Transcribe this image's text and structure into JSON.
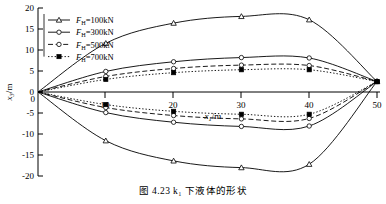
{
  "figure": {
    "caption": "图 4.23  k₁ 下液体的形状"
  },
  "chart_data": {
    "type": "line",
    "title": "",
    "xlabel": "x₁/m",
    "ylabel": "x₃/m",
    "xlim": [
      0,
      52
    ],
    "ylim": [
      -20,
      20
    ],
    "xticks": [
      10,
      20,
      30,
      40,
      50
    ],
    "yticks": [
      20,
      15,
      10,
      5,
      0,
      -5,
      -10,
      -15,
      -20
    ],
    "grid": false,
    "legend_position": "top-left",
    "x": [
      0,
      10,
      20,
      30,
      40,
      50
    ],
    "series": [
      {
        "name": "F_H=100kN",
        "legend_label": "F",
        "legend_sub": "H",
        "legend_value": "=100kN",
        "marker": "triangle-open",
        "linestyle": "solid",
        "upper_values": [
          0,
          11.6,
          16.4,
          18.0,
          17.2,
          2.5
        ],
        "lower_values": [
          0,
          -11.6,
          -16.4,
          -18.0,
          -17.2,
          2.5
        ]
      },
      {
        "name": "F_H=300kN",
        "legend_label": "F",
        "legend_sub": "H",
        "legend_value": "=300kN",
        "marker": "circle-open",
        "linestyle": "solid",
        "upper_values": [
          0,
          4.9,
          7.2,
          8.2,
          8.1,
          2.5
        ],
        "lower_values": [
          0,
          -4.9,
          -7.2,
          -8.2,
          -8.1,
          2.5
        ]
      },
      {
        "name": "F_H=500kN",
        "legend_label": "F",
        "legend_sub": "H",
        "legend_value": "=500kN",
        "marker": "circle-open",
        "linestyle": "dashed",
        "upper_values": [
          0,
          3.7,
          5.6,
          6.4,
          6.3,
          2.5
        ],
        "lower_values": [
          0,
          -3.7,
          -5.6,
          -6.4,
          -6.3,
          2.5
        ]
      },
      {
        "name": "F_H=700kN",
        "legend_label": "F",
        "legend_sub": "H",
        "legend_value": "=700kN",
        "marker": "square-filled",
        "linestyle": "dotted",
        "upper_values": [
          0,
          3.0,
          4.6,
          5.3,
          5.3,
          2.5
        ],
        "lower_values": [
          0,
          -3.0,
          -4.6,
          -5.3,
          -5.3,
          2.5
        ]
      }
    ]
  }
}
